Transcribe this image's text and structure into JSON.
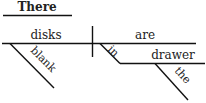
{
  "diagram": {
    "type": "sentence-diagram",
    "expletive": "There",
    "subject": "disks",
    "subject_modifier": "blank",
    "verb": "are",
    "preposition": "in",
    "prep_object": "drawer",
    "prep_object_modifier": "the"
  }
}
